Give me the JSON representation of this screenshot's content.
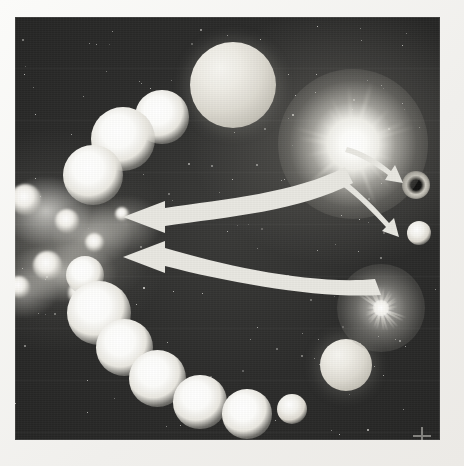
{
  "figure": {
    "kind": "astronomy-illustration",
    "panel": {
      "x": 15,
      "y": 17,
      "width": 425,
      "height": 423
    },
    "background_color": "#2c2c2b",
    "paper_color": "#f3f2ef",
    "glow_color": "#ffffff"
  },
  "objects": {
    "nebula": {
      "name": "interstellar-nebula",
      "label": "",
      "x": -22,
      "y": 150,
      "width": 190,
      "height": 170,
      "knots": [
        {
          "x": 30,
          "y": 30,
          "r": 13
        },
        {
          "x": 72,
          "y": 52,
          "r": 10
        },
        {
          "x": 52,
          "y": 96,
          "r": 12
        },
        {
          "x": 100,
          "y": 74,
          "r": 8
        },
        {
          "x": 24,
          "y": 118,
          "r": 9
        },
        {
          "x": 86,
          "y": 124,
          "r": 11
        },
        {
          "x": 128,
          "y": 46,
          "r": 6
        }
      ]
    },
    "giant_star": {
      "name": "giant-star",
      "cx": 218,
      "cy": 68,
      "r": 43
    },
    "ray_star": {
      "name": "bright-main-sequence-star",
      "cx": 323,
      "cy": 110,
      "r": 75,
      "spikes": 22
    },
    "supernova": {
      "name": "supernova-remnant",
      "cx": 366,
      "cy": 291,
      "r": 44,
      "filaments": 26
    },
    "compact_remnant": {
      "name": "black-hole-remnant",
      "cx": 401,
      "cy": 168,
      "r": 14,
      "core_r": 5
    },
    "white_dwarf": {
      "name": "white-dwarf-star",
      "cx": 404,
      "cy": 216,
      "r": 12
    },
    "lower_giant": {
      "name": "lower-giant-star",
      "cx": 331,
      "cy": 348,
      "r": 26
    },
    "companion": {
      "name": "companion-star",
      "cx": 277,
      "cy": 392,
      "r": 15
    }
  },
  "star_chain": {
    "name": "stellar-sequence-chain",
    "description": "ring of evolving stars",
    "members": [
      {
        "cx": 147,
        "cy": 100,
        "r": 14
      },
      {
        "cx": 108,
        "cy": 122,
        "r": 17
      },
      {
        "cx": 78,
        "cy": 158,
        "r": 16
      },
      {
        "cx": 70,
        "cy": 258,
        "r": 10
      },
      {
        "cx": 84,
        "cy": 296,
        "r": 17
      },
      {
        "cx": 109,
        "cy": 330,
        "r": 15
      },
      {
        "cx": 142,
        "cy": 361,
        "r": 15
      },
      {
        "cx": 185,
        "cy": 385,
        "r": 14
      },
      {
        "cx": 232,
        "cy": 397,
        "r": 13
      }
    ]
  },
  "arrows": {
    "major": [
      {
        "name": "recycle-arrow-upper",
        "from": [
          300,
          172
        ],
        "to": [
          112,
          216
        ],
        "width": 13,
        "meaning": "ejected material returns to nebula"
      },
      {
        "name": "recycle-arrow-lower",
        "from": [
          352,
          268
        ],
        "to": [
          112,
          252
        ],
        "width": 13,
        "meaning": "supernova debris returns to nebula"
      }
    ],
    "minor": [
      {
        "name": "remnant-arrow-black-hole",
        "from": [
          358,
          142
        ],
        "to": [
          388,
          163
        ],
        "width": 5
      },
      {
        "name": "remnant-arrow-white-dwarf",
        "from": [
          350,
          176
        ],
        "to": [
          389,
          213
        ],
        "width": 5
      }
    ]
  },
  "starfield": {
    "name": "background-stars",
    "count": 150,
    "color": "#efeee9"
  },
  "registration_mark": {
    "name": "corner-crosshair",
    "x": 398,
    "y": 410,
    "size": 18
  }
}
